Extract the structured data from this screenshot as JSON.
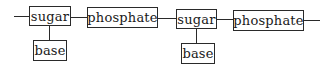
{
  "diagram": {
    "nodes": [
      {
        "id": "sugar1",
        "label": "sugar"
      },
      {
        "id": "base1",
        "label": "base"
      },
      {
        "id": "phosphate1",
        "label": "phosphate"
      },
      {
        "id": "sugar2",
        "label": "sugar"
      },
      {
        "id": "base2",
        "label": "base"
      },
      {
        "id": "phosphate2",
        "label": "phosphate"
      }
    ],
    "edges": [
      [
        "start",
        "sugar1"
      ],
      [
        "sugar1",
        "base1"
      ],
      [
        "sugar1",
        "phosphate1"
      ],
      [
        "phosphate1",
        "sugar2"
      ],
      [
        "sugar2",
        "base2"
      ],
      [
        "sugar2",
        "phosphate2"
      ],
      [
        "phosphate2",
        "end"
      ]
    ]
  }
}
